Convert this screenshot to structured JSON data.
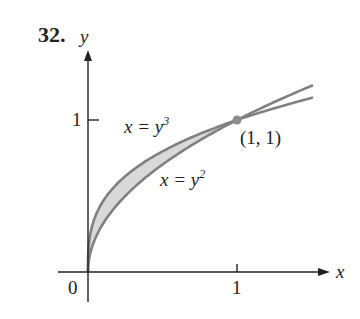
{
  "problem_number": "32.",
  "axes": {
    "x_label": "x",
    "y_label": "y",
    "origin_label": "0",
    "x_tick_label": "1",
    "y_tick_label": "1"
  },
  "curves": [
    {
      "name": "cube",
      "label_base": "x = y",
      "label_exp": "3",
      "equation": "x = y^3"
    },
    {
      "name": "square",
      "label_base": "x = y",
      "label_exp": "2",
      "equation": "x = y^2"
    }
  ],
  "intersection_point": {
    "label": "(1, 1)",
    "x": 1,
    "y": 1
  },
  "colors": {
    "axis": "#222222",
    "curve": "#808080",
    "shading": "#d9d9d9",
    "point": "#8c8c8c"
  },
  "chart_data": {
    "type": "line",
    "title": "32.",
    "xlabel": "x",
    "ylabel": "y",
    "xlim": [
      0,
      1.5
    ],
    "ylim": [
      0,
      1.25
    ],
    "x_ticks": [
      0,
      1
    ],
    "y_ticks": [
      1
    ],
    "series": [
      {
        "name": "x = y^3",
        "function": "y = x^(1/3)",
        "x": [
          0,
          0.125,
          0.25,
          0.5,
          1,
          1.5
        ],
        "values": [
          0,
          0.5,
          0.63,
          0.794,
          1,
          1.145
        ]
      },
      {
        "name": "x = y^2",
        "function": "y = x^(1/2)",
        "x": [
          0,
          0.125,
          0.25,
          0.5,
          1,
          1.5
        ],
        "values": [
          0,
          0.354,
          0.5,
          0.707,
          1,
          1.225
        ]
      }
    ],
    "shaded_region": "between x = y^3 and x = y^2 for 0 <= y <= 1",
    "annotations": [
      {
        "text": "(1, 1)",
        "x": 1,
        "y": 1
      }
    ],
    "grid": false
  }
}
